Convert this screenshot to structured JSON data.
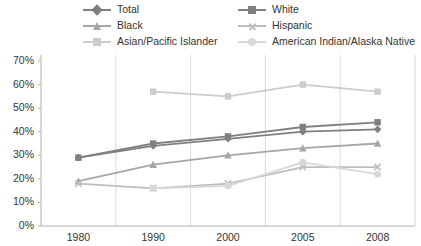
{
  "chart_data": {
    "type": "line",
    "title": "",
    "subtitle": "",
    "xlabel": "",
    "ylabel": "",
    "x": [
      "1980",
      "1990",
      "2000",
      "2005",
      "2008"
    ],
    "categories": [
      "1980",
      "1990",
      "2000",
      "2005",
      "2008"
    ],
    "ylim": [
      0,
      70
    ],
    "ytick_labels": [
      "0%",
      "10%",
      "20%",
      "30%",
      "40%",
      "50%",
      "60%",
      "70%"
    ],
    "ytick_values": [
      0,
      10,
      20,
      30,
      40,
      50,
      60,
      70
    ],
    "grid": "vertical",
    "legend_position": "top",
    "legend_columns": 2,
    "series": [
      {
        "name": "Total",
        "marker": "diamond",
        "color": "#7f7f7f",
        "values": [
          29,
          34,
          37,
          40,
          41
        ]
      },
      {
        "name": "White",
        "marker": "square",
        "color": "#808080",
        "values": [
          29,
          35,
          38,
          42,
          44
        ]
      },
      {
        "name": "Black",
        "marker": "triangle",
        "color": "#a6a6a6",
        "values": [
          19,
          26,
          30,
          33,
          35
        ]
      },
      {
        "name": "Hispanic",
        "marker": "x",
        "color": "#bdbdbd",
        "values": [
          18,
          16,
          18,
          25,
          25
        ]
      },
      {
        "name": "Asian/Pacific Islander",
        "marker": "dash",
        "color": "#cccccc",
        "values": [
          null,
          57,
          55,
          60,
          57
        ]
      },
      {
        "name": "American Indian/Alaska Native",
        "marker": "circle",
        "color": "#d9d9d9",
        "values": [
          null,
          16,
          17,
          27,
          22
        ]
      }
    ]
  },
  "legend": {
    "items": [
      {
        "label": "Total",
        "color": "#7f7f7f",
        "marker": "diamond"
      },
      {
        "label": "White",
        "color": "#808080",
        "marker": "square"
      },
      {
        "label": "Black",
        "color": "#a6a6a6",
        "marker": "triangle"
      },
      {
        "label": "Hispanic",
        "color": "#bdbdbd",
        "marker": "x"
      },
      {
        "label": "Asian/Pacific Islander",
        "color": "#cccccc",
        "marker": "dash"
      },
      {
        "label": "American Indian/Alaska Native",
        "color": "#d9d9d9",
        "marker": "circle"
      }
    ]
  },
  "axes": {
    "y_labels": [
      "70%",
      "60%",
      "50%",
      "40%",
      "30%",
      "20%",
      "10%",
      "0%"
    ],
    "x_labels": [
      "1980",
      "1990",
      "2000",
      "2005",
      "2008"
    ]
  },
  "colors": {
    "background": "#ffffff",
    "axis": "#b0b0b0",
    "grid": "#d0d0d0",
    "text": "#333333"
  }
}
